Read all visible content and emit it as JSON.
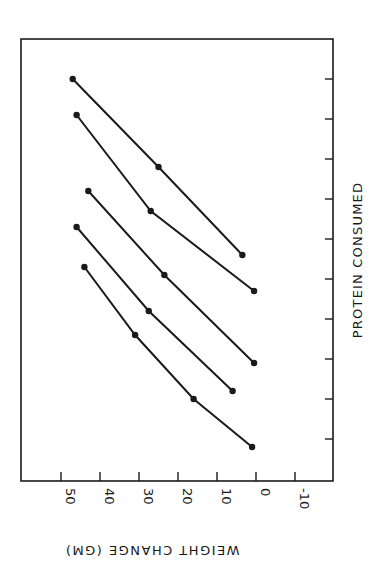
{
  "chart_data": {
    "type": "line",
    "title": "",
    "orientation_note": "figure printed rotated 90 degrees; weight axis runs along bottom, protein axis along right side",
    "xlabel": "PROTEIN CONSUMED",
    "ylabel": "WEIGHT CHANGE (GM)",
    "ylim": [
      -10,
      50
    ],
    "y_ticks": [
      50,
      40,
      30,
      20,
      10,
      0,
      -10
    ],
    "y_tick_labels": [
      "50",
      "40",
      "30",
      "20",
      "10",
      "0",
      "-10"
    ],
    "x_ticks_count": 10,
    "x_tick_labels": [],
    "grid": false,
    "legend": null,
    "series": [
      {
        "name": "Line 1",
        "x": [
          1,
          3.2,
          5.4
        ],
        "values": [
          47,
          25,
          3.5
        ]
      },
      {
        "name": "Line 2",
        "x": [
          1.9,
          4.3,
          6.3
        ],
        "values": [
          46,
          27,
          0.5
        ]
      },
      {
        "name": "Line 3",
        "x": [
          3.8,
          5.9,
          8.1
        ],
        "values": [
          43,
          23.5,
          0.5
        ]
      },
      {
        "name": "Line 4",
        "x": [
          4.7,
          6.8,
          8.8
        ],
        "values": [
          46,
          27.5,
          6
        ]
      },
      {
        "name": "Line 5",
        "x": [
          5.7,
          7.4,
          9.0,
          10.2
        ],
        "values": [
          44,
          31,
          16,
          1
        ]
      }
    ]
  },
  "axes": {
    "weight_label": "WEIGHT CHANGE (GM)",
    "protein_label": "PROTEIN CONSUMED"
  },
  "colors": {
    "ink": "#1a1a1a",
    "background": "#ffffff"
  }
}
